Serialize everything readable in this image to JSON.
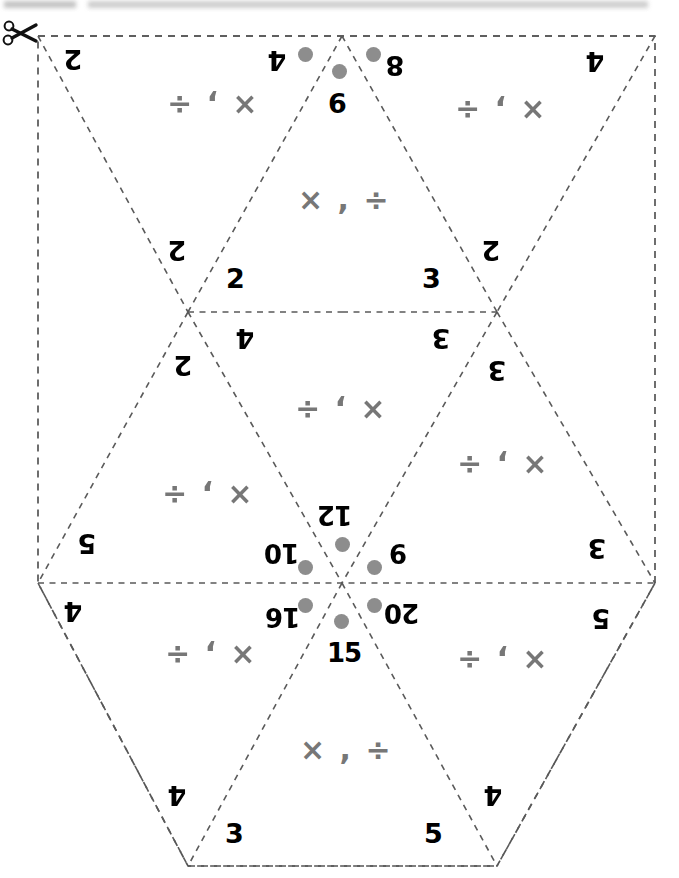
{
  "page": {
    "cut_icon": "scissors-icon",
    "background_color": "#ffffff",
    "cutline_color": "#555555",
    "operator_color": "#777777",
    "dot_color": "#8d8d8d"
  },
  "operators": {
    "symbol_pair": "× , ÷"
  },
  "triangles": [
    {
      "id": "top-left",
      "orientation": "down",
      "rotation_deg": 180,
      "operators": "× , ÷",
      "corner_values": [
        "2",
        "2"
      ]
    },
    {
      "id": "top-center",
      "orientation": "up",
      "rotation_deg": 0,
      "operators": "× , ÷",
      "apex_value": "6",
      "corner_values": [
        "2",
        "3"
      ]
    },
    {
      "id": "top-right",
      "orientation": "down",
      "rotation_deg": 180,
      "operators": "× , ÷",
      "corner_values": [
        "4",
        "2"
      ]
    },
    {
      "id": "middle-left",
      "orientation": "up",
      "rotation_deg": 180,
      "operators": "× , ÷",
      "apex_value": "2",
      "corner_values": [
        "5",
        "10"
      ]
    },
    {
      "id": "middle-center",
      "orientation": "down",
      "rotation_deg": 180,
      "operators": "× , ÷",
      "apex_value": "12",
      "corner_values": [
        "4",
        "3"
      ]
    },
    {
      "id": "middle-right",
      "orientation": "up",
      "rotation_deg": 180,
      "operators": "× , ÷",
      "apex_value": "3",
      "corner_values": [
        "3",
        "9"
      ]
    },
    {
      "id": "bottom-left",
      "orientation": "down",
      "rotation_deg": 180,
      "operators": "× , ÷",
      "apex_value": "4",
      "corner_values": [
        "4",
        "16"
      ]
    },
    {
      "id": "bottom-center",
      "orientation": "up",
      "rotation_deg": 0,
      "operators": "× , ÷",
      "apex_value": "15",
      "corner_values": [
        "3",
        "5"
      ]
    },
    {
      "id": "bottom-right",
      "orientation": "down",
      "rotation_deg": 180,
      "operators": "× , ÷",
      "apex_value": "4",
      "corner_values": [
        "5",
        "4"
      ]
    }
  ],
  "edge_numbers": {
    "top_left_outer": "2",
    "top_center_left": "4",
    "top_center_right": "8",
    "top_right_outer": "4",
    "upper_vertex_left_2": "2",
    "upper_vertex_up_2": "2",
    "upper_vertex_down_4": "4",
    "upper_vertex_left_lower_2": "2",
    "upper_right_vertex_2": "2",
    "upper_right_vertex_3": "3",
    "upper_right_vertex_3b": "3",
    "upper_right_vertex_3c": "3",
    "left_vertex_5": "5",
    "left_vertex_4": "4",
    "right_vertex_3": "3",
    "right_vertex_5": "5",
    "bottom_left_4": "4",
    "bottom_center_3": "3",
    "bottom_center_5": "5",
    "bottom_right_4": "4"
  },
  "hub": {
    "description": "center pinwheel numbers, each with a gray dot",
    "values": [
      "12",
      "9",
      "20",
      "15",
      "16",
      "10"
    ]
  },
  "dots": {
    "count": 8,
    "locations": [
      "top-center-apex",
      "top-center-left",
      "top-center-right",
      "hub-12",
      "hub-9",
      "hub-20",
      "hub-15",
      "hub-16",
      "hub-10"
    ]
  }
}
